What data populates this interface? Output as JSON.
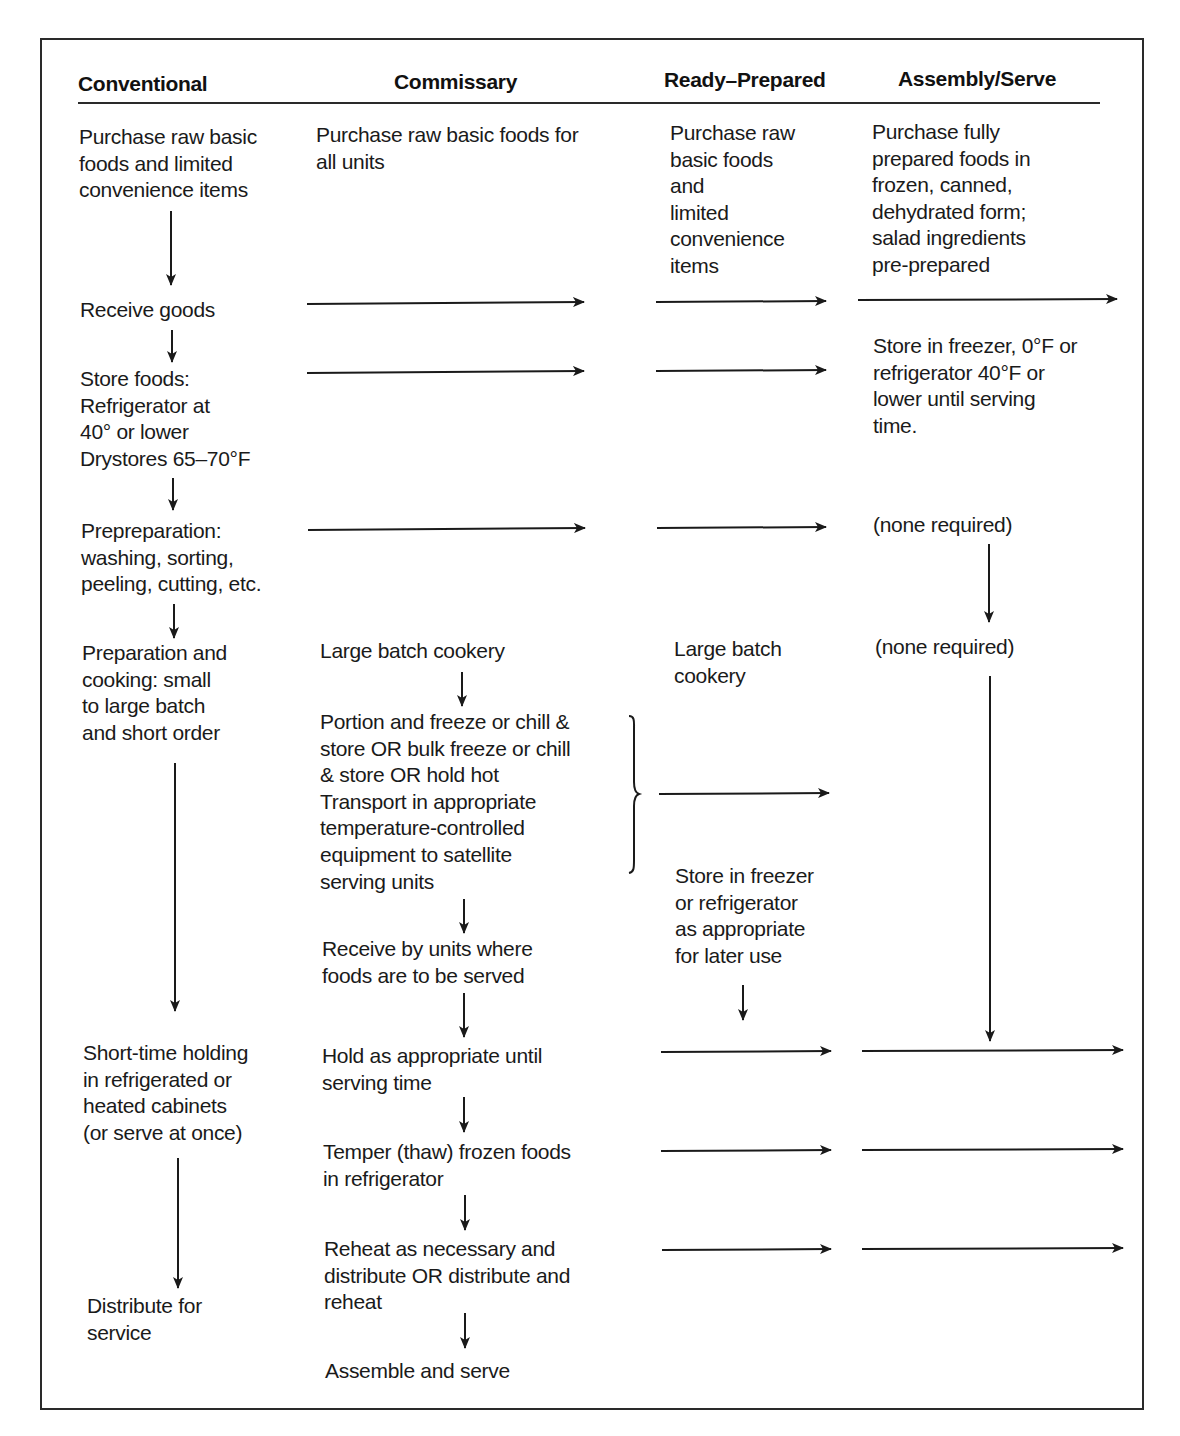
{
  "diagram": {
    "type": "flowchart",
    "columns": [
      {
        "id": "conventional",
        "label": "Conventional"
      },
      {
        "id": "commissary",
        "label": "Commissary"
      },
      {
        "id": "ready_prepared",
        "label": "Ready–Prepared"
      },
      {
        "id": "assembly_serve",
        "label": "Assembly/Serve"
      }
    ],
    "conventional": {
      "purchase": "Purchase raw basic\nfoods and limited\nconvenience items",
      "receive": "Receive goods",
      "store": "Store foods:\nRefrigerator at\n40° or lower\nDrystores 65–70°F",
      "preprep": "Prepreparation:\nwashing, sorting,\npeeling, cutting, etc.",
      "prep": "Preparation and\ncooking: small\nto large batch\nand short order",
      "holding": "Short-time holding\nin refrigerated or\nheated cabinets\n(or serve at once)",
      "distribute": "Distribute for\nservice"
    },
    "commissary": {
      "purchase": "Purchase raw basic foods for\nall units",
      "batch": "Large batch cookery",
      "portion": "Portion and freeze or chill &\nstore OR bulk freeze or chill\n& store OR hold hot\nTransport in appropriate\ntemperature-controlled\nequipment to satellite\nserving units",
      "receive_units": "Receive by units where\nfoods are to be served",
      "hold": "Hold as appropriate until\nserving time",
      "temper": "Temper (thaw) frozen foods\nin refrigerator",
      "reheat": "Reheat as necessary and\ndistribute OR distribute and\nreheat",
      "assemble": "Assemble and serve"
    },
    "ready_prepared": {
      "purchase": "Purchase raw\nbasic foods\nand\nlimited\nconvenience\nitems",
      "batch": "Large batch\ncookery",
      "store": "Store in freezer\nor refrigerator\nas appropriate\nfor later use"
    },
    "assembly_serve": {
      "purchase": "Purchase fully\nprepared foods in\nfrozen, canned,\ndehydrated form;\nsalad ingredients\npre-prepared",
      "store": "Store in freezer, 0°F or\nrefrigerator 40°F or\nlower until serving\ntime.",
      "none1": "(none required)",
      "none2": "(none required)"
    }
  }
}
